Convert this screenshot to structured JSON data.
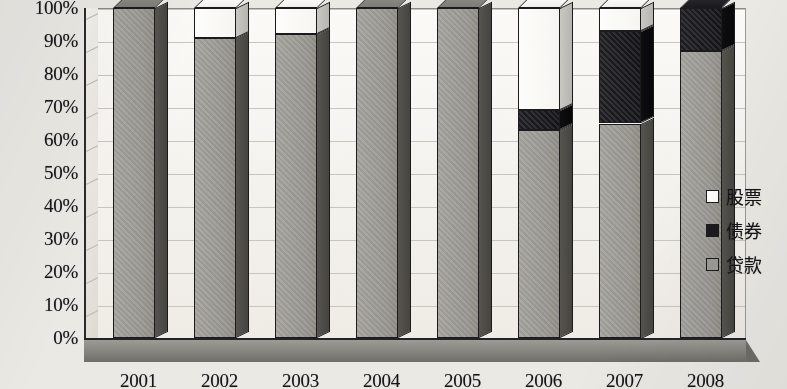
{
  "chart_data": {
    "type": "bar",
    "subtype": "100% stacked column (3D)",
    "title": "",
    "xlabel": "",
    "ylabel": "",
    "categories": [
      "2001",
      "2002",
      "2003",
      "2004",
      "2005",
      "2006",
      "2007",
      "2008"
    ],
    "series": [
      {
        "name": "贷款",
        "color": "#9d9b95",
        "values": [
          100,
          91,
          92,
          100,
          100,
          63,
          65,
          87
        ]
      },
      {
        "name": "债券",
        "color": "#1a1a1f",
        "values": [
          0,
          0,
          0,
          0,
          0,
          6,
          28,
          13
        ]
      },
      {
        "name": "股票",
        "color": "#fdfdfb",
        "values": [
          0,
          9,
          8,
          0,
          0,
          31,
          7,
          0
        ]
      }
    ],
    "stack_order_bottom_to_top": [
      "贷款",
      "债券",
      "股票"
    ],
    "ylim": [
      0,
      100
    ],
    "ytick_labels": [
      "0%",
      "10%",
      "20%",
      "30%",
      "40%",
      "50%",
      "60%",
      "70%",
      "80%",
      "90%",
      "100%"
    ],
    "ytick_values": [
      0,
      10,
      20,
      30,
      40,
      50,
      60,
      70,
      80,
      90,
      100
    ],
    "grid": true,
    "grid_axis": "y",
    "legend_position": "right",
    "legend_entries": [
      {
        "label": "股票",
        "swatch": "white"
      },
      {
        "label": "债券",
        "swatch": "black"
      },
      {
        "label": "贷款",
        "swatch": "gray"
      }
    ]
  }
}
